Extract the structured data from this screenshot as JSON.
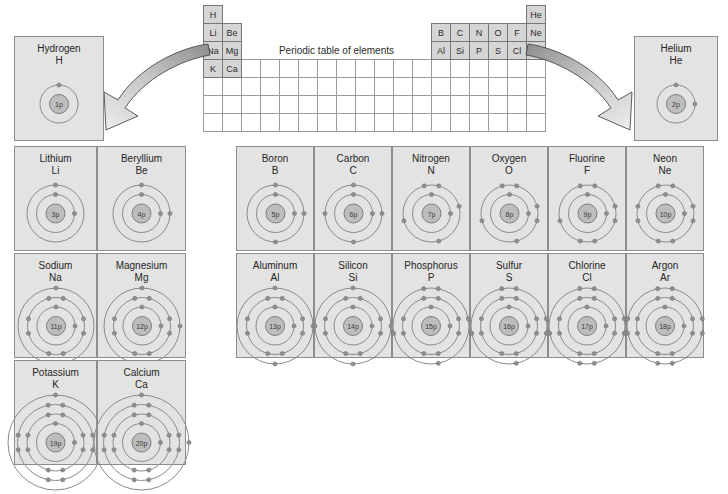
{
  "diagram": {
    "title": "Periodic table of elements"
  },
  "periodic_table": {
    "title": "Periodic table of elements",
    "columns": 18,
    "rows": 7,
    "filled_cells": [
      {
        "row": 0,
        "col": 0,
        "symbol": "H"
      },
      {
        "row": 0,
        "col": 17,
        "symbol": "He"
      },
      {
        "row": 1,
        "col": 0,
        "symbol": "Li"
      },
      {
        "row": 1,
        "col": 1,
        "symbol": "Be"
      },
      {
        "row": 1,
        "col": 12,
        "symbol": "B"
      },
      {
        "row": 1,
        "col": 13,
        "symbol": "C"
      },
      {
        "row": 1,
        "col": 14,
        "symbol": "N"
      },
      {
        "row": 1,
        "col": 15,
        "symbol": "O"
      },
      {
        "row": 1,
        "col": 16,
        "symbol": "F"
      },
      {
        "row": 1,
        "col": 17,
        "symbol": "Ne"
      },
      {
        "row": 2,
        "col": 0,
        "symbol": "Na"
      },
      {
        "row": 2,
        "col": 1,
        "symbol": "Mg"
      },
      {
        "row": 2,
        "col": 12,
        "symbol": "Al"
      },
      {
        "row": 2,
        "col": 13,
        "symbol": "Si"
      },
      {
        "row": 2,
        "col": 14,
        "symbol": "P"
      },
      {
        "row": 2,
        "col": 15,
        "symbol": "S"
      },
      {
        "row": 2,
        "col": 16,
        "symbol": "Cl"
      },
      {
        "row": 2,
        "col": 17,
        "symbol": "Ar"
      },
      {
        "row": 3,
        "col": 0,
        "symbol": "K"
      },
      {
        "row": 3,
        "col": 1,
        "symbol": "Ca"
      }
    ]
  },
  "elements": {
    "hydrogen": {
      "name": "Hydrogen",
      "symbol": "H",
      "nucleus": "1p",
      "shells": [
        1
      ]
    },
    "helium": {
      "name": "Helium",
      "symbol": "He",
      "nucleus": "2p",
      "shells": [
        2
      ]
    },
    "lithium": {
      "name": "Lithium",
      "symbol": "Li",
      "nucleus": "3p",
      "shells": [
        2,
        1
      ]
    },
    "beryllium": {
      "name": "Beryllium",
      "symbol": "Be",
      "nucleus": "4p",
      "shells": [
        2,
        2
      ]
    },
    "sodium": {
      "name": "Sodium",
      "symbol": "Na",
      "nucleus": "11p",
      "shells": [
        2,
        8,
        1
      ]
    },
    "magnesium": {
      "name": "Magnesium",
      "symbol": "Mg",
      "nucleus": "12p",
      "shells": [
        2,
        8,
        2
      ]
    },
    "potassium": {
      "name": "Potassium",
      "symbol": "K",
      "nucleus": "19p",
      "shells": [
        2,
        8,
        8,
        1
      ]
    },
    "calcium": {
      "name": "Calcium",
      "symbol": "Ca",
      "nucleus": "20p",
      "shells": [
        2,
        8,
        8,
        2
      ]
    },
    "boron": {
      "name": "Boron",
      "symbol": "B",
      "nucleus": "5p",
      "shells": [
        2,
        3
      ]
    },
    "carbon": {
      "name": "Carbon",
      "symbol": "C",
      "nucleus": "6p",
      "shells": [
        2,
        4
      ]
    },
    "nitrogen": {
      "name": "Nitrogen",
      "symbol": "N",
      "nucleus": "7p",
      "shells": [
        2,
        5
      ]
    },
    "oxygen": {
      "name": "Oxygen",
      "symbol": "O",
      "nucleus": "8p",
      "shells": [
        2,
        6
      ]
    },
    "fluorine": {
      "name": "Fluorine",
      "symbol": "F",
      "nucleus": "9p",
      "shells": [
        2,
        7
      ]
    },
    "neon": {
      "name": "Neon",
      "symbol": "Ne",
      "nucleus": "10p",
      "shells": [
        2,
        8
      ]
    },
    "aluminum": {
      "name": "Aluminum",
      "symbol": "Al",
      "nucleus": "13p",
      "shells": [
        2,
        8,
        3
      ]
    },
    "silicon": {
      "name": "Silicon",
      "symbol": "Si",
      "nucleus": "14p",
      "shells": [
        2,
        8,
        4
      ]
    },
    "phosphorus": {
      "name": "Phosphorus",
      "symbol": "P",
      "nucleus": "15p",
      "shells": [
        2,
        8,
        5
      ]
    },
    "sulfur": {
      "name": "Sulfur",
      "symbol": "S",
      "nucleus": "16p",
      "shells": [
        2,
        8,
        6
      ]
    },
    "chlorine": {
      "name": "Chlorine",
      "symbol": "Cl",
      "nucleus": "17p",
      "shells": [
        2,
        8,
        7
      ]
    },
    "argon": {
      "name": "Argon",
      "symbol": "Ar",
      "nucleus": "18p",
      "shells": [
        2,
        8,
        8
      ]
    }
  },
  "layout": {
    "left_panel": [
      {
        "key": "hydrogen",
        "x": 14,
        "y": 36,
        "w": 90,
        "h": 105
      },
      {
        "key": "lithium",
        "x": 14,
        "y": 146,
        "w": 83,
        "h": 105
      },
      {
        "key": "beryllium",
        "x": 97,
        "y": 146,
        "w": 89,
        "h": 105
      },
      {
        "key": "sodium",
        "x": 14,
        "y": 253,
        "w": 83,
        "h": 105
      },
      {
        "key": "magnesium",
        "x": 97,
        "y": 253,
        "w": 89,
        "h": 105
      },
      {
        "key": "potassium",
        "x": 14,
        "y": 360,
        "w": 83,
        "h": 105
      },
      {
        "key": "calcium",
        "x": 97,
        "y": 360,
        "w": 89,
        "h": 105
      }
    ],
    "right_panel": [
      {
        "key": "helium",
        "x": 634,
        "y": 36,
        "w": 84,
        "h": 105
      }
    ],
    "main_panel": [
      {
        "key": "boron",
        "x": 236,
        "y": 146,
        "w": 78,
        "h": 105
      },
      {
        "key": "carbon",
        "x": 314,
        "y": 146,
        "w": 78,
        "h": 105
      },
      {
        "key": "nitrogen",
        "x": 392,
        "y": 146,
        "w": 78,
        "h": 105
      },
      {
        "key": "oxygen",
        "x": 470,
        "y": 146,
        "w": 78,
        "h": 105
      },
      {
        "key": "fluorine",
        "x": 548,
        "y": 146,
        "w": 78,
        "h": 105
      },
      {
        "key": "neon",
        "x": 626,
        "y": 146,
        "w": 78,
        "h": 105
      },
      {
        "key": "aluminum",
        "x": 236,
        "y": 253,
        "w": 78,
        "h": 105
      },
      {
        "key": "silicon",
        "x": 314,
        "y": 253,
        "w": 78,
        "h": 105
      },
      {
        "key": "phosphorus",
        "x": 392,
        "y": 253,
        "w": 78,
        "h": 105
      },
      {
        "key": "sulfur",
        "x": 470,
        "y": 253,
        "w": 78,
        "h": 105
      },
      {
        "key": "chlorine",
        "x": 548,
        "y": 253,
        "w": 78,
        "h": 105
      },
      {
        "key": "argon",
        "x": 626,
        "y": 253,
        "w": 78,
        "h": 105
      }
    ]
  },
  "colors": {
    "card_fill": "#e3e3e3",
    "card_border": "#8d8d8d",
    "table_filled": "#d5d5d5",
    "table_border": "#9a9a9a",
    "shell_stroke": "#8a8a8a",
    "nucleus_fill": "#bdbdbd",
    "electron_fill": "#8f8f8f",
    "arrow_fill": "#c9c9c9"
  },
  "arrows": [
    {
      "name": "arrow-to-hydrogen",
      "direction": "down-left"
    },
    {
      "name": "arrow-to-helium",
      "direction": "down-right"
    }
  ]
}
